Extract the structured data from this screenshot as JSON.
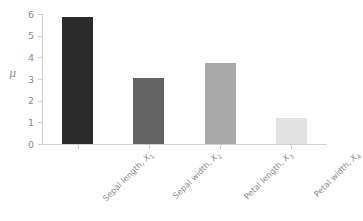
{
  "chart_data": {
    "type": "bar",
    "title": "",
    "subtitle": "",
    "xlabel": "",
    "ylabel": "μ",
    "categories": [
      "Sepal length, X₁",
      "Sepal width, X₂",
      "Petal length, X₃",
      "Petal width, X₄"
    ],
    "category_parts": [
      {
        "text": "Sepal length, ",
        "var": "X",
        "sub": "1"
      },
      {
        "text": "Sepal width, ",
        "var": "X",
        "sub": "2"
      },
      {
        "text": "Petal length, ",
        "var": "X",
        "sub": "3"
      },
      {
        "text": "Petal width, ",
        "var": "X",
        "sub": "4"
      }
    ],
    "values": [
      5.84,
      3.05,
      3.76,
      1.2
    ],
    "bar_colors": [
      "#2b2b2b",
      "#636363",
      "#a8a8a8",
      "#e2e2e2"
    ],
    "ylim": [
      0,
      6
    ],
    "yticks": [
      0,
      1,
      2,
      3,
      4,
      5,
      6
    ],
    "ytick_labels": [
      "0",
      "1",
      "2",
      "3",
      "4",
      "5",
      "6"
    ],
    "grid": false,
    "legend": false,
    "legend_position": "none",
    "axis_color": "#cfcfcf",
    "text_color": "#8a8a8a",
    "background": "#ffffff"
  }
}
